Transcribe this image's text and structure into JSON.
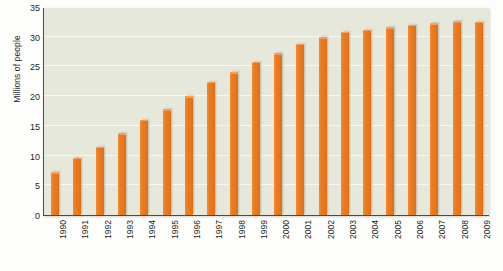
{
  "chart_data": {
    "type": "bar",
    "title": "",
    "xlabel": "",
    "ylabel": "Millions of people",
    "ylim": [
      0,
      35
    ],
    "yticks": [
      0,
      5,
      10,
      15,
      20,
      25,
      30,
      35
    ],
    "grid": true,
    "legend": "none",
    "bar_color": "#e8761c",
    "plot_background": "#e7e8dc",
    "categories": [
      "1990",
      "1991",
      "1992",
      "1993",
      "1994",
      "1995",
      "1996",
      "1997",
      "1998",
      "1999",
      "2000",
      "2001",
      "2002",
      "2003",
      "2004",
      "2005",
      "2006",
      "2007",
      "2008",
      "2009"
    ],
    "values": [
      7.2,
      9.6,
      11.5,
      13.8,
      16.0,
      17.8,
      20.0,
      22.4,
      24.0,
      25.8,
      27.2,
      28.8,
      29.9,
      30.8,
      31.2,
      31.6,
      32.0,
      32.3,
      32.6,
      32.5
    ]
  }
}
